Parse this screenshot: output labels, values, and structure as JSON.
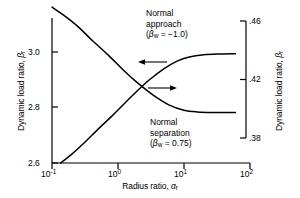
{
  "chart_data": {
    "type": "line",
    "title": "",
    "subtitle": "",
    "xlabel": "Radius ratio, αr",
    "xlabel_main": "Radius ratio, ",
    "xlabel_sym": "α",
    "xlabel_sub": "r",
    "ylabel_left": "Dynamic load ratio, βr",
    "ylabel_right": "Dynamic load ratio, βr",
    "ylabel_main": "Dynamic load ratio, ",
    "ylabel_sym": "β",
    "ylabel_sub": "r",
    "xscale": "log",
    "xlim": [
      0.1,
      100
    ],
    "xticks": [
      0.1,
      1,
      10,
      100
    ],
    "xticklabels": [
      "10⁻¹",
      "10⁰",
      "10¹",
      "10²"
    ],
    "xtick_exponents": [
      "-1",
      "0",
      "1",
      "2"
    ],
    "xtick_base": "10",
    "ylim_left": [
      2.6,
      3.05
    ],
    "yticks_left": [
      2.6,
      2.8,
      3.0
    ],
    "yticklabels_left": [
      "2.6",
      "2.8",
      "3.0"
    ],
    "ylim_right": [
      0.365,
      0.4695
    ],
    "yticks_right": [
      0.38,
      0.42,
      0.46
    ],
    "yticklabels_right": [
      ".38",
      ".42",
      ".46"
    ],
    "grid": false,
    "legend": "annotations",
    "series": [
      {
        "name": "Normal approach",
        "axis": "left",
        "annotation": "Normal approach (βw = -1.0)",
        "annotation_lines": [
          "Normal",
          "approach",
          "(βw = −1.0)"
        ],
        "parameter_symbol": "β",
        "parameter_sub": "w",
        "parameter_value": "−1.0",
        "arrow_direction": "left",
        "x": [
          0.135,
          0.2,
          0.3,
          0.5,
          0.8,
          1.2,
          2.0,
          3.0,
          5.0,
          8.0,
          12.0,
          20.0,
          35.0,
          60.0
        ],
        "y": [
          2.6,
          2.632,
          2.67,
          2.722,
          2.768,
          2.81,
          2.862,
          2.9,
          2.94,
          2.968,
          2.982,
          2.99,
          2.993,
          2.994
        ]
      },
      {
        "name": "Normal separation",
        "axis": "right",
        "annotation": "Normal separation (βw = 0.75)",
        "annotation_lines": [
          "Normal",
          "separation",
          "(βw = 0.75)"
        ],
        "parameter_symbol": "β",
        "parameter_sub": "w",
        "parameter_value": "0.75",
        "arrow_direction": "right",
        "x": [
          0.1,
          0.15,
          0.25,
          0.4,
          0.7,
          1.2,
          2.0,
          3.5,
          6.0,
          10.0,
          16.0,
          28.0,
          45.0,
          60.0
        ],
        "y": [
          0.4695,
          0.464,
          0.456,
          0.447,
          0.437,
          0.4265,
          0.4175,
          0.409,
          0.4025,
          0.399,
          0.3978,
          0.3974,
          0.3974,
          0.3974
        ]
      }
    ]
  }
}
